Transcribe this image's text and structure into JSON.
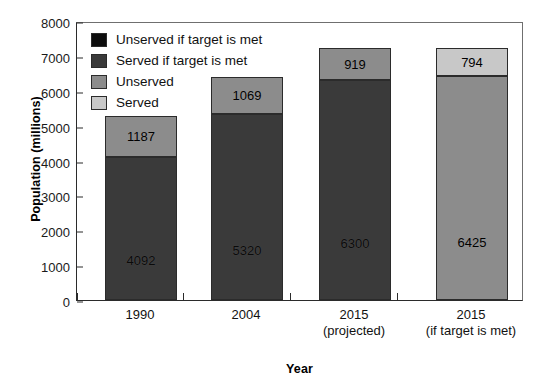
{
  "chart_data": {
    "type": "bar",
    "subtype": "stacked-bar",
    "title": "",
    "xlabel": "Year",
    "ylabel": "Population (millions)",
    "ylim": [
      0,
      8000
    ],
    "yticks": [
      0,
      1000,
      2000,
      3000,
      4000,
      5000,
      6000,
      7000,
      8000
    ],
    "ytick_labels": [
      "0",
      "1000",
      "2000",
      "3000",
      "4000",
      "5000",
      "6000",
      "7000",
      "8000"
    ],
    "grid": false,
    "legend_position": "upper-left-inside",
    "categories": [
      "1990",
      "2004",
      "2015",
      "2015"
    ],
    "category_lines": [
      {
        "line1": "1990",
        "line2": ""
      },
      {
        "line1": "2004",
        "line2": ""
      },
      {
        "line1": "2015",
        "line2": "(projected)"
      },
      {
        "line1": "2015",
        "line2": "(if target is met)"
      }
    ],
    "legend": [
      {
        "label": "Unserved if target is met",
        "color": "#0d0d0d"
      },
      {
        "label": "Served if target is met",
        "color": "#3a3a3a"
      },
      {
        "label": "Unserved",
        "color": "#8c8c8c"
      },
      {
        "label": "Served",
        "color": "#c8c8c8"
      }
    ],
    "series": [
      {
        "name": "Served if target is met",
        "color": "#3a3a3a",
        "values": [
          4092,
          5320,
          6300,
          null
        ]
      },
      {
        "name": "Unserved",
        "color": "#8c8c8c",
        "values": [
          1187,
          1069,
          919,
          6425
        ]
      },
      {
        "name": "Served",
        "color": "#c8c8c8",
        "values": [
          null,
          null,
          null,
          794
        ]
      }
    ],
    "bars": [
      {
        "category": "1990",
        "total": 5279,
        "segments": [
          {
            "series": "Served if target is met",
            "value": 4092,
            "label": "4092",
            "color": "#3a3a3a",
            "from": 0,
            "to": 4092
          },
          {
            "series": "Unserved",
            "value": 1187,
            "label": "1187",
            "color": "#8c8c8c",
            "from": 4092,
            "to": 5279
          }
        ]
      },
      {
        "category": "2004",
        "total": 6389,
        "segments": [
          {
            "series": "Served if target is met",
            "value": 5320,
            "label": "5320",
            "color": "#3a3a3a",
            "from": 0,
            "to": 5320
          },
          {
            "series": "Unserved",
            "value": 1069,
            "label": "1069",
            "color": "#8c8c8c",
            "from": 5320,
            "to": 6389
          }
        ]
      },
      {
        "category": "2015 (projected)",
        "total": 7219,
        "segments": [
          {
            "series": "Served if target is met",
            "value": 6300,
            "label": "6300",
            "color": "#3a3a3a",
            "from": 0,
            "to": 6300
          },
          {
            "series": "Unserved",
            "value": 919,
            "label": "919",
            "color": "#8c8c8c",
            "from": 6300,
            "to": 7219
          }
        ]
      },
      {
        "category": "2015 (if target is met)",
        "total": 7219,
        "segments": [
          {
            "series": "Unserved",
            "value": 6425,
            "label": "6425",
            "color": "#8c8c8c",
            "from": 0,
            "to": 6425
          },
          {
            "series": "Served",
            "value": 794,
            "label": "794",
            "color": "#c8c8c8",
            "from": 6425,
            "to": 7219
          }
        ]
      }
    ]
  },
  "axes": {
    "y_title": "Population (millions)",
    "x_title": "Year"
  },
  "colors": {
    "black": "#0d0d0d",
    "dark_gray": "#3a3a3a",
    "mid_gray": "#8c8c8c",
    "light_gray": "#c8c8c8",
    "axis": "#2b2b2b",
    "background": "#ffffff"
  }
}
